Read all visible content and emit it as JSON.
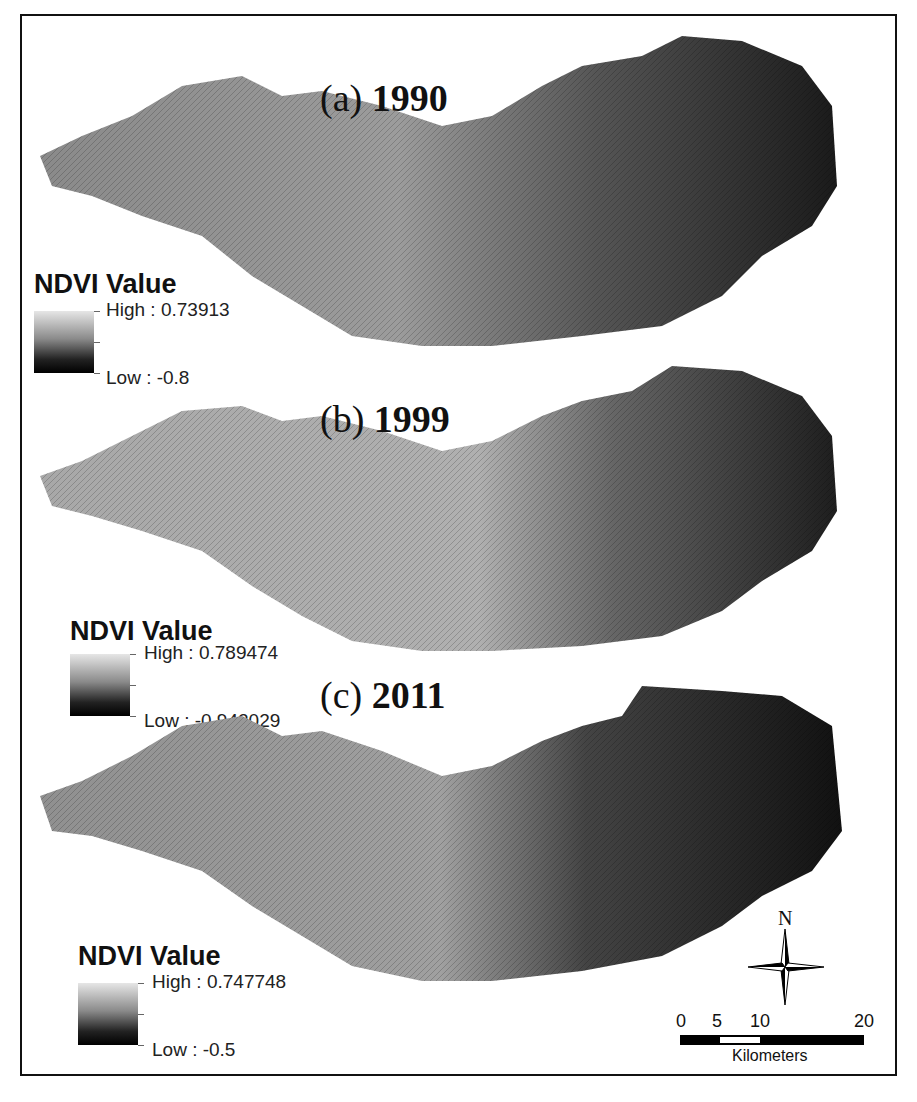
{
  "figure": {
    "type": "NDVI map series",
    "panels": [
      {
        "label": "(a)",
        "year": "1990",
        "legend": {
          "title": "NDVI Value",
          "high_label": "High : 0.73913",
          "low_label": "Low : -0.8",
          "high": 0.73913,
          "low": -0.8
        }
      },
      {
        "label": "(b)",
        "year": "1999",
        "legend": {
          "title": "NDVI Value",
          "high_label": "High : 0.789474",
          "low_label": "Low : -0.942029",
          "high": 0.789474,
          "low": -0.942029
        }
      },
      {
        "label": "(c)",
        "year": "2011",
        "legend": {
          "title": "NDVI Value",
          "high_label": "High : 0.747748",
          "low_label": "Low : -0.5",
          "high": 0.747748,
          "low": -0.5
        }
      }
    ],
    "north_arrow": {
      "label": "N"
    },
    "scale_bar": {
      "ticks": [
        "0",
        "5",
        "10",
        "20"
      ],
      "unit": "Kilometers"
    },
    "colors": {
      "ramp_high": "#e6e6e6",
      "ramp_low": "#000000",
      "frame": "#111111"
    }
  }
}
